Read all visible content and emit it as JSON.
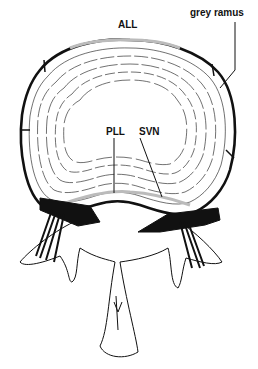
{
  "figure": {
    "labels": {
      "all": "ALL",
      "grey_ramus": "grey ramus",
      "pll": "PLL",
      "svn": "SVN"
    },
    "colors": {
      "line": "#111111",
      "background": "#ffffff"
    }
  }
}
